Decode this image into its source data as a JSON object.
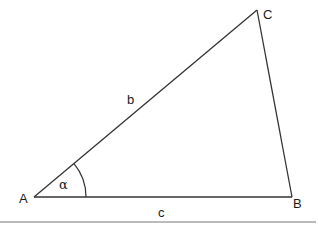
{
  "diagram": {
    "type": "triangle",
    "vertices": {
      "A": {
        "label": "A",
        "x": 34,
        "y": 197
      },
      "B": {
        "label": "B",
        "x": 292,
        "y": 197
      },
      "C": {
        "label": "C",
        "x": 257,
        "y": 10
      }
    },
    "sides": {
      "b": {
        "label": "b",
        "from": "A",
        "to": "C"
      },
      "c": {
        "label": "c",
        "from": "A",
        "to": "B"
      },
      "a": {
        "from": "B",
        "to": "C"
      }
    },
    "angle": {
      "label": "α",
      "vertex": "A"
    },
    "colors": {
      "stroke": "#333333",
      "text": "#1a1a1a",
      "rule": "#777777"
    }
  }
}
